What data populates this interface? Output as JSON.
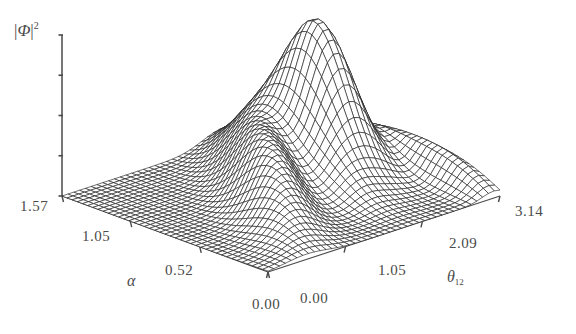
{
  "figure": {
    "kind": "3d-surface-mesh-plot",
    "background_color": "#ffffff",
    "mesh_color": "#1a1a1a",
    "axis_color": "#4a4a4a",
    "width": 576,
    "height": 334
  },
  "zaxis": {
    "label_parts": {
      "open_bar": "|",
      "symbol": "Φ",
      "close_bar": "|",
      "exponent": "2"
    },
    "label_text": "|Φ|²",
    "tick_count": 5,
    "tick_labels": []
  },
  "alpha_axis": {
    "name": "α",
    "ticks": [
      "1.57",
      "1.05",
      "0.52",
      "0.00"
    ],
    "values": [
      1.57,
      1.05,
      0.52,
      0.0
    ],
    "label_positions": [
      {
        "text": "1.57",
        "x": 20,
        "y": 198
      },
      {
        "text": "1.05",
        "x": 82,
        "y": 228
      },
      {
        "text": "0.52",
        "x": 165,
        "y": 262
      },
      {
        "text": "0.00",
        "x": 252,
        "y": 296
      }
    ],
    "name_position": {
      "x": 127,
      "y": 272
    }
  },
  "theta_axis": {
    "name": "θ",
    "subscript": "12",
    "name_text": "θ₁₂",
    "ticks": [
      "0.00",
      "1.05",
      "2.09",
      "3.14"
    ],
    "values": [
      0.0,
      1.05,
      2.09,
      3.14
    ],
    "label_positions": [
      {
        "text": "0.00",
        "x": 300,
        "y": 290
      },
      {
        "text": "1.05",
        "x": 378,
        "y": 262
      },
      {
        "text": "2.09",
        "x": 449,
        "y": 235
      },
      {
        "text": "3.14",
        "x": 515,
        "y": 203
      }
    ],
    "name_position": {
      "x": 447,
      "y": 268
    }
  },
  "chart_data": {
    "type": "surface",
    "title": "",
    "xlabel": "α",
    "ylabel": "θ_12",
    "zlabel": "|Φ|^2",
    "xlim": [
      0.0,
      1.57
    ],
    "ylim": [
      0.0,
      3.14
    ],
    "zlim": [
      0.0,
      1.0
    ],
    "grid": false,
    "legend": null,
    "features": [
      {
        "name": "main-peak",
        "alpha": 0.92,
        "theta12": 2.3,
        "height": 1.0
      },
      {
        "name": "diagonal-ridge",
        "alpha": 0.62,
        "theta12": 1.35,
        "height": 0.5
      },
      {
        "name": "edge-ridge",
        "alpha": 0.2,
        "theta12": 3.05,
        "height": 0.22
      },
      {
        "name": "valley",
        "alpha": 0.8,
        "theta12": 1.75,
        "height": 0.08
      }
    ],
    "grid_resolution": {
      "n_alpha": 40,
      "n_theta": 40
    }
  },
  "projection": {
    "origin_front": {
      "x": 268,
      "y": 272
    },
    "corner_left": {
      "x": 62,
      "y": 196
    },
    "corner_right": {
      "x": 500,
      "y": 196
    },
    "z_axis_top": {
      "x": 62,
      "y": 35
    },
    "z_height_px": 161
  }
}
